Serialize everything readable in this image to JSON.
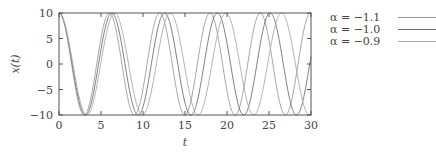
{
  "chart_data": {
    "type": "line",
    "title": "",
    "xlabel": "t",
    "ylabel": "x(t)",
    "xlim": [
      0,
      30
    ],
    "ylim": [
      -10,
      10
    ],
    "xticks": [
      0,
      5,
      10,
      15,
      20,
      25,
      30
    ],
    "yticks": [
      10,
      5,
      0,
      -5,
      -10
    ],
    "ytick_labels": [
      "10",
      "5",
      "0",
      "−5",
      "−10"
    ],
    "grid": false,
    "legend_position": "outside-right-top",
    "function": "x(t) = 10·cos(√(−α)·t)",
    "series": [
      {
        "name": "α = −1.1",
        "alpha": -1.1,
        "omega": 1.0488,
        "amplitude": 10,
        "color": "#9a9a9a"
      },
      {
        "name": "α = −1.0",
        "alpha": -1.0,
        "omega": 1.0,
        "amplitude": 10,
        "color": "#6e6e6e"
      },
      {
        "name": "α = −0.9",
        "alpha": -0.9,
        "omega": 0.9487,
        "amplitude": 10,
        "color": "#a8a8a8"
      }
    ]
  },
  "legend": {
    "items": [
      {
        "label": "α = −1.1",
        "color": "#9a9a9a"
      },
      {
        "label": "α = −1.0",
        "color": "#6e6e6e"
      },
      {
        "label": "α = −0.9",
        "color": "#a8a8a8"
      }
    ]
  }
}
